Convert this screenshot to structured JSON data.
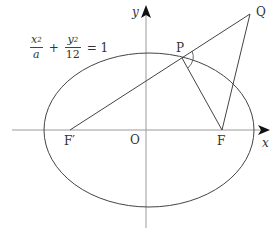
{
  "diagram": {
    "type": "ellipse-focal-geometry",
    "equation": {
      "term1_num": "x",
      "term1_exp": "2",
      "term1_den": "a",
      "plus": "+",
      "term2_num": "y",
      "term2_exp": "2",
      "term2_den": "12",
      "equals": "= 1"
    },
    "axes": {
      "x_label": "x",
      "y_label": "y",
      "origin_label": "O"
    },
    "points": {
      "F_prime": "F′",
      "F": "F",
      "P": "P",
      "Q": "Q"
    },
    "colors": {
      "stroke": "#444444",
      "axis": "#9a9a9a",
      "text": "#333333"
    }
  }
}
